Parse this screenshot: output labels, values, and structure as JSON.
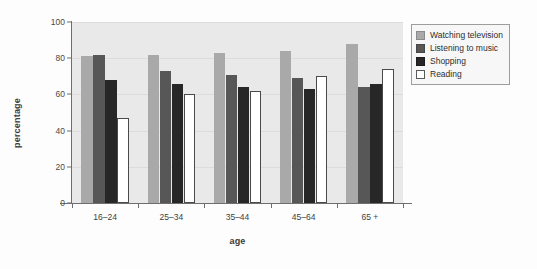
{
  "chart_data": {
    "type": "bar",
    "title": "",
    "subtitle": "",
    "xlabel": "age",
    "ylabel": "percentage",
    "categories": [
      "16–24",
      "25–34",
      "35–44",
      "45–64",
      "65 +"
    ],
    "series": [
      {
        "name": "Watching television",
        "color": "#a9a9a9",
        "values": [
          81,
          82,
          83,
          84,
          88
        ]
      },
      {
        "name": "Listening to music",
        "color": "#575757",
        "values": [
          82,
          73,
          71,
          69,
          64
        ]
      },
      {
        "name": "Shopping",
        "color": "#272727",
        "values": [
          68,
          66,
          64,
          63,
          66
        ]
      },
      {
        "name": "Reading",
        "color": "#ffffff",
        "values": [
          47,
          60,
          62,
          70,
          74
        ]
      }
    ],
    "ylim": [
      0,
      100
    ],
    "yticks": [
      0,
      20,
      40,
      60,
      80,
      100
    ],
    "ytick_labels": [
      "0",
      "20",
      "40",
      "60",
      "80",
      "100"
    ],
    "grid": true,
    "legend_position": "right",
    "plot_background": "#e9e9e9",
    "axis_color": "#6e6e6e"
  }
}
